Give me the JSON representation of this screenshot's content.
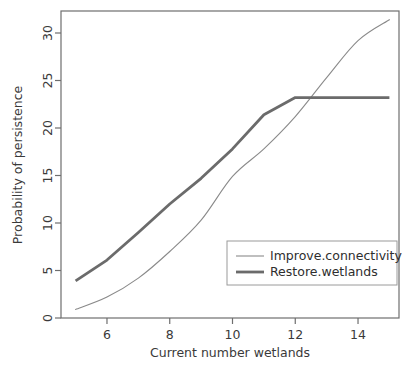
{
  "chart_data": {
    "type": "line",
    "title": "",
    "xlabel": "Current number wetlands",
    "ylabel": "Probability of persistence",
    "xlim": [
      4.6,
      15.4
    ],
    "ylim": [
      -0.6,
      32.5
    ],
    "xticks": [
      6,
      8,
      10,
      12,
      14
    ],
    "yticks": [
      0,
      5,
      10,
      15,
      20,
      25,
      30
    ],
    "grid": false,
    "legend_position": "bottom-right",
    "x": [
      5,
      6,
      7,
      8,
      9,
      10,
      11,
      12,
      13,
      14,
      15
    ],
    "series": [
      {
        "name": "Improve.connectivity",
        "style": "thin",
        "color": "#8a8a8a",
        "values": [
          0.9,
          2.2,
          4.2,
          7.0,
          10.3,
          14.9,
          17.8,
          21.2,
          25.3,
          29.2,
          31.4
        ]
      },
      {
        "name": "Restore.wetlands",
        "style": "thick",
        "color": "#6b6b6b",
        "values": [
          3.9,
          6.1,
          9.0,
          12.0,
          14.7,
          17.8,
          21.4,
          23.2,
          23.2,
          23.2,
          23.2
        ]
      }
    ]
  },
  "legend": {
    "entries": [
      {
        "label": "Improve.connectivity",
        "style": "thin"
      },
      {
        "label": "Restore.wetlands",
        "style": "thick"
      }
    ]
  },
  "axes": {
    "x_title": "Current number wetlands",
    "y_title": "Probability of persistence",
    "x_tick_labels": [
      "6",
      "8",
      "10",
      "12",
      "14"
    ],
    "y_tick_labels": [
      "0",
      "5",
      "10",
      "15",
      "20",
      "25",
      "30"
    ]
  }
}
